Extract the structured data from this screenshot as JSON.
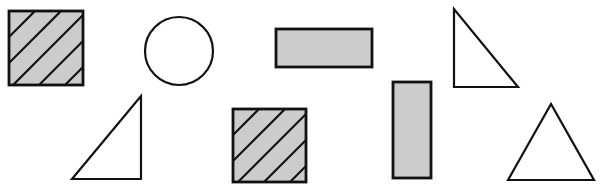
{
  "diagram": {
    "title": "",
    "background": "#ffffff",
    "stroke_color": "#111111",
    "fill_color": "#cccccc",
    "stroke_width": 2.2,
    "shapes": [
      {
        "id": "square-hatched-1",
        "type": "square",
        "fill": "gray",
        "hatched": true,
        "x": 9,
        "y": 11,
        "w": 74,
        "h": 74
      },
      {
        "id": "circle-1",
        "type": "circle",
        "fill": "none",
        "cx": 179,
        "cy": 51,
        "r": 34
      },
      {
        "id": "rectangle-horizontal-1",
        "type": "rectangle",
        "fill": "gray",
        "hatched": false,
        "x": 276,
        "y": 29,
        "w": 96,
        "h": 38
      },
      {
        "id": "right-triangle-1",
        "type": "right-triangle",
        "fill": "none",
        "points": [
          [
            454,
            9
          ],
          [
            454,
            87
          ],
          [
            518,
            87
          ]
        ]
      },
      {
        "id": "right-triangle-2",
        "type": "right-triangle",
        "fill": "none",
        "points": [
          [
            72,
            179
          ],
          [
            141,
            96
          ],
          [
            141,
            179
          ]
        ]
      },
      {
        "id": "square-hatched-2",
        "type": "square",
        "fill": "gray",
        "hatched": true,
        "x": 233,
        "y": 109,
        "w": 73,
        "h": 73
      },
      {
        "id": "rectangle-vertical-1",
        "type": "rectangle",
        "fill": "gray",
        "hatched": false,
        "x": 393,
        "y": 82,
        "w": 38,
        "h": 96
      },
      {
        "id": "equilateral-triangle-1",
        "type": "equilateral-triangle",
        "fill": "none",
        "points": [
          [
            508,
            180
          ],
          [
            551,
            104
          ],
          [
            594,
            180
          ]
        ]
      }
    ]
  }
}
